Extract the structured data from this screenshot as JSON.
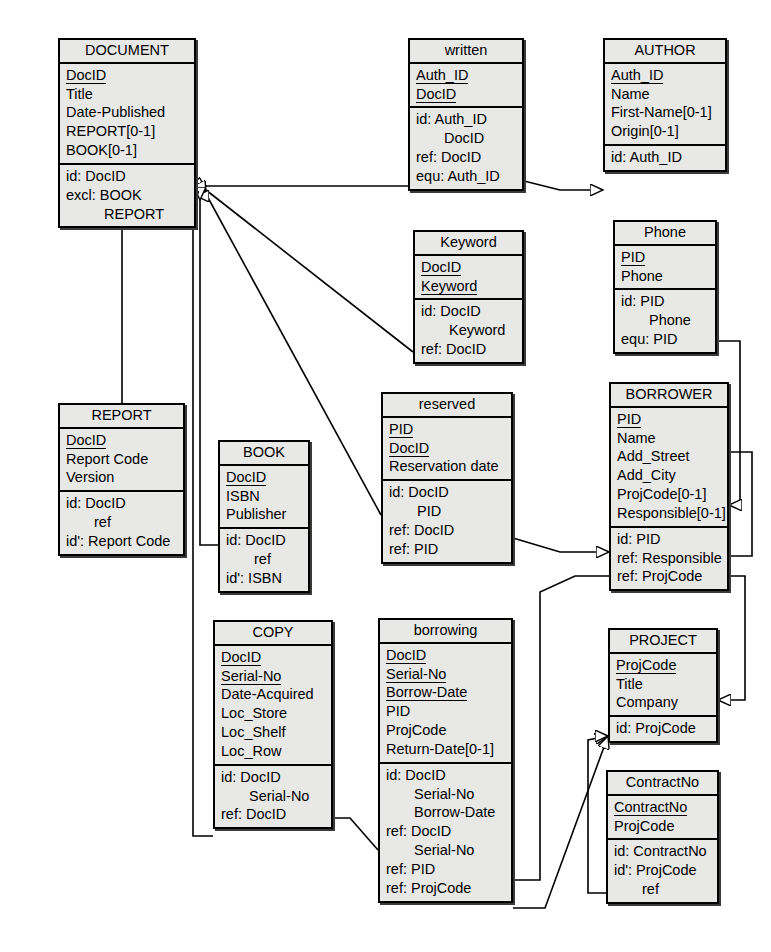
{
  "diagram": {
    "style": {
      "box_fill": "#e8e8e6",
      "border": "#000000",
      "line": "#000000",
      "background": "#ffffff"
    },
    "entities": [
      {
        "id": "document",
        "name": "DOCUMENT",
        "x": 58,
        "y": 38,
        "w": 138,
        "attributes": [
          {
            "text": "DocID",
            "key": true
          },
          {
            "text": "Title",
            "key": false
          },
          {
            "text": "Date-Published",
            "key": false
          },
          {
            "text": "REPORT[0-1]",
            "key": false
          },
          {
            "text": "BOOK[0-1]",
            "key": false
          }
        ],
        "constraints": [
          {
            "text": "id: DocID",
            "indent": 0
          },
          {
            "text": "excl: BOOK",
            "indent": 0
          },
          {
            "text": "REPORT",
            "indent": 2
          }
        ]
      },
      {
        "id": "written",
        "name": "written",
        "x": 408,
        "y": 38,
        "w": 116,
        "attributes": [
          {
            "text": "Auth_ID",
            "key": true
          },
          {
            "text": "DocID",
            "key": true
          }
        ],
        "constraints": [
          {
            "text": "id: Auth_ID",
            "indent": 0
          },
          {
            "text": "DocID",
            "indent": 1
          },
          {
            "text": "ref: DocID",
            "indent": 0
          },
          {
            "text": "equ: Auth_ID",
            "indent": 0
          }
        ]
      },
      {
        "id": "author",
        "name": "AUTHOR",
        "x": 603,
        "y": 38,
        "w": 124,
        "attributes": [
          {
            "text": "Auth_ID",
            "key": true
          },
          {
            "text": "Name",
            "key": false
          },
          {
            "text": "First-Name[0-1]",
            "key": false
          },
          {
            "text": "Origin[0-1]",
            "key": false
          }
        ],
        "constraints": [
          {
            "text": "id: Auth_ID",
            "indent": 0
          }
        ]
      },
      {
        "id": "keyword",
        "name": "Keyword",
        "x": 413,
        "y": 230,
        "w": 111,
        "attributes": [
          {
            "text": "DocID",
            "key": true
          },
          {
            "text": "Keyword",
            "key": true
          }
        ],
        "constraints": [
          {
            "text": "id: DocID",
            "indent": 0
          },
          {
            "text": "Keyword",
            "indent": 1
          },
          {
            "text": "ref: DocID",
            "indent": 0
          }
        ]
      },
      {
        "id": "phone",
        "name": "Phone",
        "x": 613,
        "y": 220,
        "w": 104,
        "attributes": [
          {
            "text": "PID",
            "key": true
          },
          {
            "text": "Phone",
            "key": false
          }
        ],
        "constraints": [
          {
            "text": "id: PID",
            "indent": 0
          },
          {
            "text": "Phone",
            "indent": 1
          },
          {
            "text": "equ: PID",
            "indent": 0
          }
        ]
      },
      {
        "id": "borrower",
        "name": "BORROWER",
        "x": 609,
        "y": 382,
        "w": 120,
        "attributes": [
          {
            "text": "PID",
            "key": true
          },
          {
            "text": "Name",
            "key": false
          },
          {
            "text": "Add_Street",
            "key": false
          },
          {
            "text": "Add_City",
            "key": false
          },
          {
            "text": "ProjCode[0-1]",
            "key": false
          },
          {
            "text": "Responsible[0-1]",
            "key": false
          }
        ],
        "constraints": [
          {
            "text": "id: PID",
            "indent": 0
          },
          {
            "text": "ref: Responsible",
            "indent": 0
          },
          {
            "text": "ref: ProjCode",
            "indent": 0
          }
        ]
      },
      {
        "id": "report",
        "name": "REPORT",
        "x": 58,
        "y": 403,
        "w": 127,
        "attributes": [
          {
            "text": "DocID",
            "key": true
          },
          {
            "text": "Report Code",
            "key": false
          },
          {
            "text": "Version",
            "key": false
          }
        ],
        "constraints": [
          {
            "text": "id: DocID",
            "indent": 0
          },
          {
            "text": "ref",
            "indent": 1
          },
          {
            "text": "id': Report Code",
            "indent": 0
          }
        ]
      },
      {
        "id": "book",
        "name": "BOOK",
        "x": 218,
        "y": 440,
        "w": 92,
        "attributes": [
          {
            "text": "DocID",
            "key": true
          },
          {
            "text": "ISBN",
            "key": false
          },
          {
            "text": "Publisher",
            "key": false
          }
        ],
        "constraints": [
          {
            "text": "id: DocID",
            "indent": 0
          },
          {
            "text": "ref",
            "indent": 1
          },
          {
            "text": "id': ISBN",
            "indent": 0
          }
        ]
      },
      {
        "id": "reserved",
        "name": "reserved",
        "x": 381,
        "y": 392,
        "w": 132,
        "attributes": [
          {
            "text": "PID",
            "key": true
          },
          {
            "text": "DocID",
            "key": true
          },
          {
            "text": "Reservation date",
            "key": false
          }
        ],
        "constraints": [
          {
            "text": "id: DocID",
            "indent": 0
          },
          {
            "text": "PID",
            "indent": 1
          },
          {
            "text": "ref: DocID",
            "indent": 0
          },
          {
            "text": "ref: PID",
            "indent": 0
          }
        ]
      },
      {
        "id": "copy",
        "name": "COPY",
        "x": 213,
        "y": 620,
        "w": 120,
        "attributes": [
          {
            "text": "DocID",
            "key": true
          },
          {
            "text": "Serial-No",
            "key": true
          },
          {
            "text": "Date-Acquired",
            "key": false
          },
          {
            "text": "Loc_Store",
            "key": false
          },
          {
            "text": "Loc_Shelf",
            "key": false
          },
          {
            "text": "Loc_Row",
            "key": false
          }
        ],
        "constraints": [
          {
            "text": "id: DocID",
            "indent": 0
          },
          {
            "text": "Serial-No",
            "indent": 1
          },
          {
            "text": "ref: DocID",
            "indent": 0
          }
        ]
      },
      {
        "id": "borrowing",
        "name": "borrowing",
        "x": 378,
        "y": 618,
        "w": 135,
        "attributes": [
          {
            "text": "DocID",
            "key": true
          },
          {
            "text": "Serial-No",
            "key": true
          },
          {
            "text": "Borrow-Date",
            "key": true
          },
          {
            "text": "PID",
            "key": false
          },
          {
            "text": "ProjCode",
            "key": false
          },
          {
            "text": "Return-Date[0-1]",
            "key": false
          }
        ],
        "constraints": [
          {
            "text": "id: DocID",
            "indent": 0
          },
          {
            "text": "Serial-No",
            "indent": 1
          },
          {
            "text": "Borrow-Date",
            "indent": 1
          },
          {
            "text": "ref: DocID",
            "indent": 0
          },
          {
            "text": "Serial-No",
            "indent": 1
          },
          {
            "text": "ref: PID",
            "indent": 0
          },
          {
            "text": "ref: ProjCode",
            "indent": 0
          }
        ]
      },
      {
        "id": "project",
        "name": "PROJECT",
        "x": 608,
        "y": 628,
        "w": 110,
        "attributes": [
          {
            "text": "ProjCode",
            "key": true
          },
          {
            "text": "Title",
            "key": false
          },
          {
            "text": "Company",
            "key": false
          }
        ],
        "constraints": [
          {
            "text": "id: ProjCode",
            "indent": 0
          }
        ]
      },
      {
        "id": "contractno",
        "name": "ContractNo",
        "x": 606,
        "y": 770,
        "w": 113,
        "attributes": [
          {
            "text": "ContractNo",
            "key": true
          },
          {
            "text": "ProjCode",
            "key": false
          }
        ],
        "constraints": [
          {
            "text": "id: ContractNo",
            "indent": 0
          },
          {
            "text": "id': ProjCode",
            "indent": 0
          },
          {
            "text": "ref",
            "indent": 1
          }
        ]
      }
    ],
    "connections": [
      {
        "from": "written",
        "to": "document",
        "label": "written-to-document"
      },
      {
        "from": "written",
        "to": "author",
        "label": "written-to-author"
      },
      {
        "from": "keyword",
        "to": "document",
        "label": "keyword-to-document"
      },
      {
        "from": "reserved",
        "to": "document",
        "label": "reserved-to-document"
      },
      {
        "from": "reserved",
        "to": "borrower",
        "label": "reserved-to-borrower"
      },
      {
        "from": "phone",
        "to": "borrower",
        "label": "phone-to-borrower"
      },
      {
        "from": "borrower",
        "to": "borrower",
        "label": "borrower-responsible-self"
      },
      {
        "from": "borrower",
        "to": "project",
        "label": "borrower-to-project"
      },
      {
        "from": "report",
        "to": "document",
        "label": "report-to-document"
      },
      {
        "from": "book",
        "to": "document",
        "label": "book-to-document"
      },
      {
        "from": "copy",
        "to": "document",
        "label": "copy-to-document"
      },
      {
        "from": "borrowing",
        "to": "copy",
        "label": "borrowing-to-copy"
      },
      {
        "from": "borrowing",
        "to": "borrower",
        "label": "borrowing-to-borrower"
      },
      {
        "from": "borrowing",
        "to": "project",
        "label": "borrowing-to-project"
      },
      {
        "from": "contractno",
        "to": "project",
        "label": "contractno-to-project"
      }
    ]
  }
}
